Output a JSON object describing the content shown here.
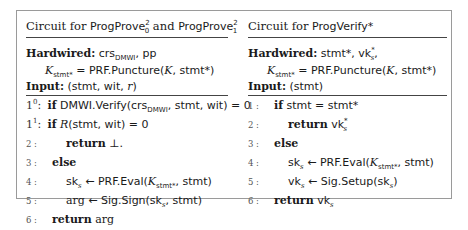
{
  "left_panel": {
    "title_prefix": "Circuit for ",
    "title_prog1": "ProgProve",
    "title_prog1_sup": "2",
    "title_prog1_sub": "0",
    "title_and": " and ",
    "title_prog2": "ProgProve",
    "title_prog2_sup": "2",
    "title_prog2_sub": "1",
    "hardwired_label": "Hardwired:",
    "hardwired_crs": "crs",
    "hardwired_crs_sub": "DMWI",
    "hardwired_rest": ", pp",
    "k_symbol": "K",
    "k_sub": "stmt*",
    "k_eq": " = PRF.Puncture(",
    "k_arg": "K",
    "k_tail": ", stmt*)",
    "input_label": "Input:",
    "input_value": " (stmt, wit, ",
    "input_r": "r",
    "input_close": ")",
    "lines": [
      {
        "num": "1",
        "sup": "0",
        "keyword": "if",
        "code": "DMWI.Verify(crs",
        "code_sub": "DMWI",
        "code_tail": ", stmt, wit) = 0"
      },
      {
        "num": "1",
        "sup": "1",
        "keyword": "if",
        "code_it": "R",
        "code": "(stmt, wit) = 0"
      },
      {
        "num": "2 :",
        "keyword": "return",
        "code": " ⊥."
      },
      {
        "num": "3 :",
        "keyword": "else",
        "code": ""
      },
      {
        "num": "4 :",
        "code": "sk",
        "code_sub": "s",
        "code_mid": " ← PRF.Eval(",
        "code_it": "K",
        "code_it_sub": "stmt*",
        "code_tail": ", stmt)"
      },
      {
        "num": "5 :",
        "code_serif": "arg",
        "code": " ← Sig.Sign(sk",
        "code_sub": "s",
        "code_tail": ", stmt)"
      },
      {
        "num": "6 :",
        "keyword": "return",
        "code_serif": " arg"
      }
    ]
  },
  "right_panel": {
    "title_prefix": "Circuit for ",
    "title_prog": "ProgVerify*",
    "hardwired_label": "Hardwired:",
    "hardwired_value": " stmt*, vk",
    "hardwired_value_sub": "s",
    "hardwired_value_sup": "*",
    "hardwired_tail": ",",
    "k_symbol": "K",
    "k_sub": "stmt*",
    "k_eq": " = PRF.Puncture(",
    "k_arg": "K",
    "k_tail": ", stmt*)",
    "input_label": "Input:",
    "input_value": " (stmt)",
    "lines": [
      {
        "num": "1 :",
        "keyword": "if",
        "code": " stmt = stmt*"
      },
      {
        "num": "2 :",
        "keyword": "return",
        "code": " vk",
        "code_sub": "s",
        "code_sup": "*"
      },
      {
        "num": "3 :",
        "keyword": "else",
        "code": ""
      },
      {
        "num": "4 :",
        "code": "sk",
        "code_sub": "s",
        "code_mid": " ← PRF.Eval(",
        "code_it": "K",
        "code_it_sub": "stmt*",
        "code_tail": ", stmt)"
      },
      {
        "num": "5 :",
        "code": "vk",
        "code_sub": "s",
        "code_mid": " ← Sig.Setup(sk",
        "code_sub2": "s",
        "code_tail": ")"
      },
      {
        "num": "6 :",
        "keyword": "return",
        "code": " vk",
        "code_sub": "s"
      }
    ]
  }
}
